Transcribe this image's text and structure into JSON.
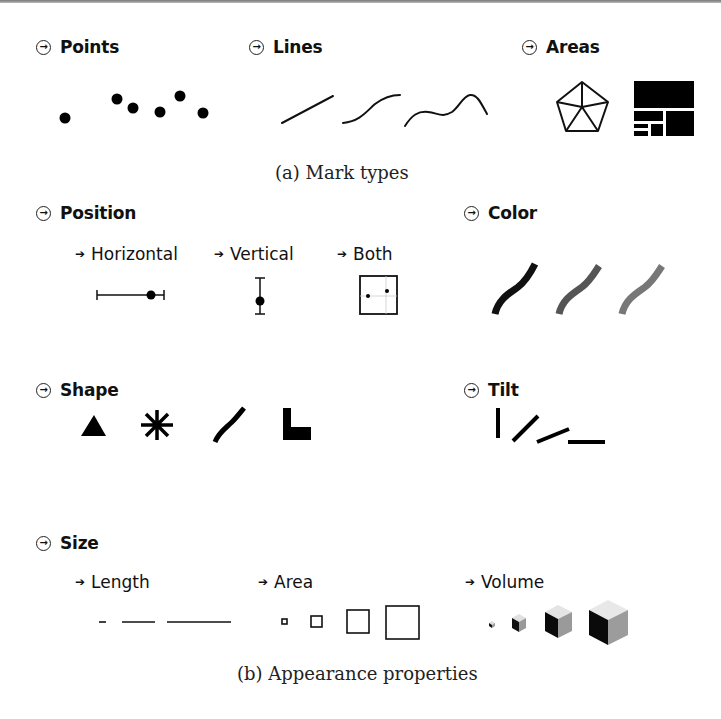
{
  "figure": {
    "section_a": {
      "caption": "(a) Mark types",
      "groups": [
        {
          "label": "Points",
          "icon": "arrow-circle-icon",
          "count": 6
        },
        {
          "label": "Lines",
          "icon": "arrow-circle-icon",
          "count": 3
        },
        {
          "label": "Areas",
          "icon": "arrow-circle-icon",
          "count": 2
        }
      ]
    },
    "section_b": {
      "caption": "(b) Appearance properties",
      "groups": [
        {
          "label": "Position",
          "icon": "arrow-circle-icon",
          "subitems": [
            {
              "label": "Horizontal"
            },
            {
              "label": "Vertical"
            },
            {
              "label": "Both"
            }
          ]
        },
        {
          "label": "Color",
          "icon": "arrow-circle-icon",
          "swatches": [
            "#111111",
            "#555555",
            "#777777"
          ]
        },
        {
          "label": "Shape",
          "icon": "arrow-circle-icon",
          "shapes": [
            "triangle",
            "asterisk",
            "curve",
            "l-shape"
          ]
        },
        {
          "label": "Tilt",
          "icon": "arrow-circle-icon",
          "angles_deg": [
            90,
            50,
            20,
            0
          ]
        },
        {
          "label": "Size",
          "icon": "arrow-circle-icon",
          "subitems": [
            {
              "label": "Length"
            },
            {
              "label": "Area"
            },
            {
              "label": "Volume"
            }
          ]
        }
      ]
    },
    "arrow_glyph": "→",
    "sub_arrow_glyph": "➔"
  }
}
